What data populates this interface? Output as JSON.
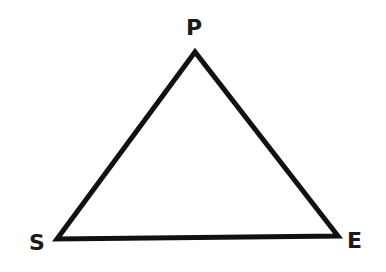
{
  "diagram": {
    "type": "triangle",
    "stroke_color": "#111111",
    "fill_color": "#ffffff",
    "vertices": [
      {
        "id": "P",
        "label": "P",
        "x": 195,
        "y": 52
      },
      {
        "id": "S",
        "label": "S",
        "x": 57,
        "y": 239
      },
      {
        "id": "E",
        "label": "E",
        "x": 338,
        "y": 236
      }
    ],
    "edges": [
      {
        "from": "S",
        "to": "P"
      },
      {
        "from": "P",
        "to": "E"
      },
      {
        "from": "E",
        "to": "S"
      }
    ]
  }
}
